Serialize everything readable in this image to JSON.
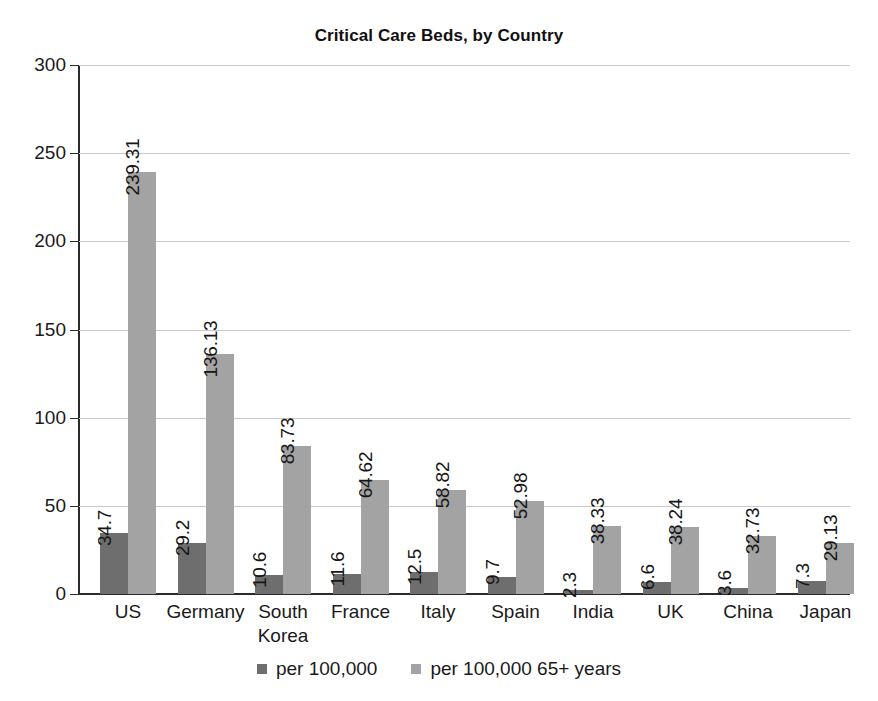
{
  "chart_data": {
    "type": "bar",
    "title": "Critical Care Beds, by Country",
    "xlabel": "",
    "ylabel": "",
    "ylim": [
      0,
      300
    ],
    "yticks": [
      0,
      50,
      100,
      150,
      200,
      250,
      300
    ],
    "ytick_labels": [
      "0",
      "50",
      "100",
      "150",
      "200",
      "250",
      "300"
    ],
    "grid": true,
    "legend_position": "bottom",
    "orientation": "vertical",
    "value_labels_rotated": true,
    "categories": [
      "US",
      "Germany",
      "South Korea",
      "France",
      "Italy",
      "Spain",
      "India",
      "UK",
      "China",
      "Japan"
    ],
    "category_label_lines": [
      [
        "US"
      ],
      [
        "Germany"
      ],
      [
        "South",
        "Korea"
      ],
      [
        "France"
      ],
      [
        "Italy"
      ],
      [
        "Spain"
      ],
      [
        "India"
      ],
      [
        "UK"
      ],
      [
        "China"
      ],
      [
        "Japan"
      ]
    ],
    "series": [
      {
        "name": "per 100,000",
        "color": "#6e6e6e",
        "values": [
          34.7,
          29.2,
          10.6,
          11.6,
          12.5,
          9.7,
          2.3,
          6.6,
          3.6,
          7.3
        ],
        "value_labels": [
          "34.7",
          "29.2",
          "10.6",
          "11.6",
          "12.5",
          "9.7",
          "2.3",
          "6.6",
          "3.6",
          "7.3"
        ]
      },
      {
        "name": "per 100,000 65+ years",
        "color": "#a3a3a3",
        "values": [
          239.31,
          136.13,
          83.73,
          64.62,
          58.82,
          52.98,
          38.33,
          38.24,
          32.73,
          29.13
        ],
        "value_labels": [
          "239.31",
          "136.13",
          "83.73",
          "64.62",
          "58.82",
          "52.98",
          "38.33",
          "38.24",
          "32.73",
          "29.13"
        ]
      }
    ]
  },
  "legend": {
    "items": [
      {
        "label": "per 100,000",
        "color": "#6e6e6e"
      },
      {
        "label": "per 100,000 65+ years",
        "color": "#a3a3a3"
      }
    ]
  },
  "colors": {
    "background": "#ffffff",
    "axis": "#2b2b2b",
    "gridline": "#c9c9c9",
    "text": "#1a1a1a",
    "series_primary": "#6e6e6e",
    "series_secondary": "#a3a3a3"
  }
}
